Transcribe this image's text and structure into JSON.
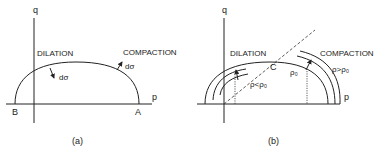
{
  "figure": {
    "panel_a": {
      "caption": "(a)",
      "axis_q": "q",
      "axis_p": "p",
      "point_b": "B",
      "point_a": "A",
      "region_left": "DILATION",
      "region_right": "COMPACTION",
      "vector_left": "dσ",
      "vector_right": "dσ"
    },
    "panel_b": {
      "caption": "(b)",
      "axis_q": "q",
      "axis_p": "p",
      "point_c": "C",
      "region_left": "DILATION",
      "region_right": "COMPACTION",
      "rho_zero": "ρ₀",
      "rho_less": "ρ<ρ₀",
      "rho_greater": "ρ>ρ₀"
    }
  }
}
